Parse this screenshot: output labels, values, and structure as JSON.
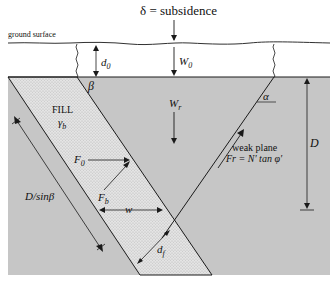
{
  "diagram": {
    "title": "δ = subsidence",
    "labels": {
      "ground_surface": "ground surface",
      "d0": "d",
      "d0_sub": "0",
      "W0": "W",
      "W0_sub": "0",
      "beta": "β",
      "alpha": "α",
      "fill": "FILL",
      "gamma_b": "γ",
      "gamma_b_sub": "b",
      "Wr": "W",
      "Wr_sub": "r",
      "D": "D",
      "D_sin_beta": "D/sinβ",
      "F0": "F",
      "F0_sub": "0",
      "Fb": "F",
      "Fb_sub": "b",
      "w": "w",
      "df": "d",
      "df_sub": "f",
      "weak_plane": "weak plane",
      "weak_plane_eq": "Fr = N′ tan φ′"
    },
    "colors": {
      "rock": "#c4c4c4",
      "fill": "#e2e2e2",
      "line": "#1a1a1a"
    }
  }
}
